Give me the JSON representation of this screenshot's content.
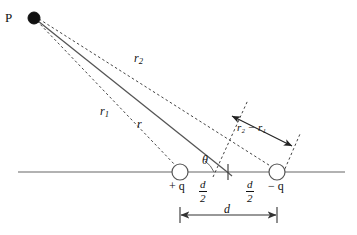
{
  "figure": {
    "point_label": "P",
    "labels": {
      "r": "r",
      "r1_main": "r",
      "r1_sub": "1",
      "r2_main": "r",
      "r2_sub": "2",
      "difference": "r₂ − r₁",
      "theta": "θ",
      "positive_charge": "+ q",
      "negative_charge": "− q",
      "separation": "d",
      "half_separation_numerator": "d",
      "half_separation_denominator": "2"
    },
    "colors": {
      "line": "#555555",
      "dashed": "#444444",
      "text": "#111111",
      "background": "#ffffff",
      "charge_fill": "#ffffff"
    },
    "geometry": {
      "point_p": {
        "x": 34,
        "y": 18,
        "radius": 6
      },
      "positive_charge": {
        "x": 180,
        "y": 172,
        "radius": 8
      },
      "negative_charge": {
        "x": 277,
        "y": 172,
        "radius": 8
      },
      "midpoint": {
        "x": 228,
        "y": 172
      },
      "axis": {
        "x1": 18,
        "x2": 345,
        "y": 172
      },
      "dimension_line": {
        "x1": 180,
        "x2": 277,
        "y": 215
      }
    }
  }
}
